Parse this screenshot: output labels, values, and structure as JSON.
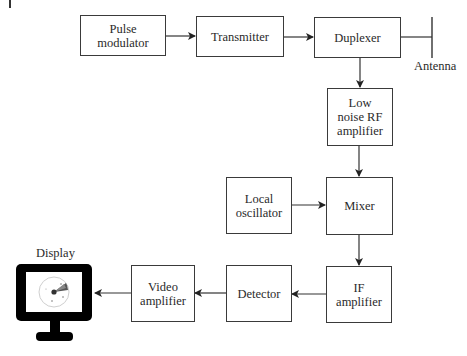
{
  "diagram": {
    "blocks": {
      "pulse_modulator": "Pulse modulator",
      "transmitter": "Transmitter",
      "duplexer": "Duplexer",
      "lna": "Low noise RF amplifier",
      "local_oscillator": "Local oscillator",
      "mixer": "Mixer",
      "if_amplifier": "IF amplifier",
      "detector": "Detector",
      "video_amplifier": "Video amplifier"
    },
    "labels": {
      "antenna": "Antenna",
      "display": "Display"
    },
    "connections": [
      {
        "from": "Pulse modulator",
        "to": "Transmitter"
      },
      {
        "from": "Transmitter",
        "to": "Duplexer"
      },
      {
        "from": "Duplexer",
        "to": "Antenna"
      },
      {
        "from": "Duplexer",
        "to": "Low noise RF amplifier"
      },
      {
        "from": "Low noise RF amplifier",
        "to": "Mixer"
      },
      {
        "from": "Local oscillator",
        "to": "Mixer"
      },
      {
        "from": "Mixer",
        "to": "IF amplifier"
      },
      {
        "from": "IF amplifier",
        "to": "Detector"
      },
      {
        "from": "Detector",
        "to": "Video amplifier"
      },
      {
        "from": "Video amplifier",
        "to": "Display"
      }
    ],
    "colors": {
      "line": "#333333",
      "monitor": "#000000",
      "screen": "#ffffff",
      "radar_ring": "#cccccc",
      "radar_sweep": "#555555"
    }
  }
}
